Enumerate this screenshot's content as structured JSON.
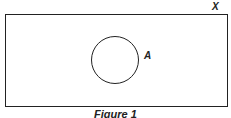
{
  "diagram": {
    "type": "venn",
    "universal_set_label": "X",
    "sets": [
      {
        "label": "A"
      }
    ],
    "caption": "Figure 1"
  }
}
